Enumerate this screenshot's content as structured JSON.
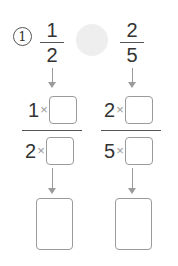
{
  "problem": {
    "number_label": "1",
    "left_fraction": {
      "numerator": "1",
      "denominator": "2"
    },
    "right_fraction": {
      "numerator": "2",
      "denominator": "5"
    },
    "comparison_symbol": ""
  },
  "conversion": {
    "left": {
      "numerator_base": "1",
      "denominator_base": "2",
      "times": "×",
      "numerator_answer": "",
      "denominator_answer": ""
    },
    "right": {
      "numerator_base": "2",
      "denominator_base": "5",
      "times": "×",
      "numerator_answer": "",
      "denominator_answer": ""
    }
  },
  "result": {
    "left_answer": "",
    "right_answer": ""
  },
  "colors": {
    "text": "#333333",
    "box_border": "#9a9a9a",
    "compare_circle": "#eeeeee",
    "arrow": "#9a9a9a"
  }
}
